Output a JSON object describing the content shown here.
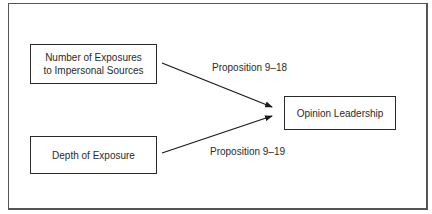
{
  "diagram": {
    "nodes": [
      {
        "id": "exposures",
        "label": "Number of Exposures\nto Impersonal Sources"
      },
      {
        "id": "depth",
        "label": "Depth of Exposure"
      },
      {
        "id": "leadership",
        "label": "Opinion Leadership"
      }
    ],
    "edges": [
      {
        "from": "exposures",
        "to": "leadership",
        "label": "Proposition 9–18"
      },
      {
        "from": "depth",
        "to": "leadership",
        "label": "Proposition 9–19"
      }
    ]
  }
}
